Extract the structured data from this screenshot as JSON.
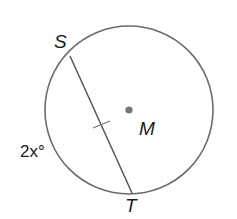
{
  "diagram": {
    "type": "circle-chord",
    "circle": {
      "name": "M",
      "center": [
        129,
        110
      ],
      "radius": 84,
      "stroke": "#6b6b6b"
    },
    "chord": {
      "from": "S",
      "to": "T",
      "stroke": "#555555",
      "congruence_tick": true
    },
    "points": {
      "S": {
        "label": "S",
        "pos": [
          70,
          56
        ]
      },
      "T": {
        "label": "T",
        "pos": [
          132,
          193
        ]
      },
      "M": {
        "label": "M",
        "pos": [
          129,
          110
        ],
        "dot_color": "#777777"
      }
    },
    "arc_label": {
      "text": "2x°",
      "arc": "ST (minor, left side)"
    }
  }
}
